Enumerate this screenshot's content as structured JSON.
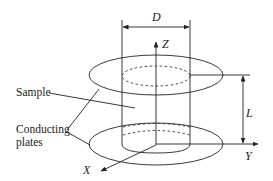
{
  "diagram": {
    "type": "schematic",
    "labels": {
      "diameter": "D",
      "length": "L",
      "axis_x": "X",
      "axis_y": "Y",
      "axis_z": "Z",
      "sample": "Sample",
      "plates_line1": "Conducting",
      "plates_line2": "plates"
    },
    "colors": {
      "line": "#222222",
      "background": "#ffffff"
    }
  }
}
